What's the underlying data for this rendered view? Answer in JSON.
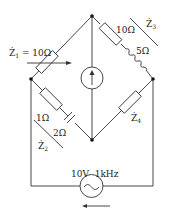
{
  "diagram": {
    "type": "ac-bridge-circuit",
    "labels": {
      "z1": "Ż",
      "z1_sub": "1",
      "z1_value": " = 10Ω",
      "z3_r": "10Ω",
      "z3_l": "5Ω",
      "z3": "Ż",
      "z3_sub": "3",
      "z2_r": "1Ω",
      "z2_c": "2Ω",
      "z2": "Ż",
      "z2_sub": "2",
      "z4": "Ż",
      "z4_sub": "4",
      "source": "10V  1kHz"
    },
    "components": [
      {
        "id": "Z1",
        "type": "variable-resistor",
        "value": "10Ω",
        "branch": "left-top"
      },
      {
        "id": "Z3",
        "type": "resistor+inductor",
        "values": [
          "10Ω",
          "5Ω"
        ],
        "branch": "right-top"
      },
      {
        "id": "Z2",
        "type": "resistor+capacitor",
        "values": [
          "1Ω",
          "2Ω"
        ],
        "branch": "left-bottom"
      },
      {
        "id": "Z4",
        "type": "impedance",
        "branch": "right-bottom"
      },
      {
        "id": "detector",
        "type": "current-source-arrow-up",
        "branch": "top-bottom diagonal"
      },
      {
        "id": "V",
        "type": "ac-voltage-source",
        "value": "10V 1kHz",
        "direction": "left"
      }
    ],
    "colors": {
      "line": "#333333",
      "background": "#ffffff"
    }
  }
}
